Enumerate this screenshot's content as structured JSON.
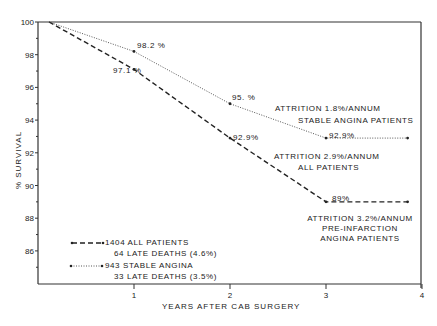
{
  "chart_data": {
    "type": "line",
    "title": "",
    "xlabel": "YEARS AFTER CAB SURGERY",
    "ylabel": "% SURVIVAL",
    "xlim": [
      0,
      4
    ],
    "ylim": [
      84,
      100
    ],
    "x_ticks": [
      "1",
      "2",
      "3",
      "4"
    ],
    "y_ticks": [
      "100",
      "98",
      "96",
      "94",
      "92",
      "90",
      "88",
      "86"
    ],
    "grid": false,
    "series": [
      {
        "name": "1404 ALL PATIENTS",
        "style": "dashed",
        "x": [
          0,
          1,
          2,
          3,
          3.85
        ],
        "values": [
          100,
          97.1,
          92.9,
          89,
          89
        ],
        "point_labels": [
          "",
          "97.1 %",
          "92.9%",
          "89%",
          ""
        ]
      },
      {
        "name": "943 STABLE ANGINA",
        "style": "dotted",
        "x": [
          0,
          1,
          2,
          3,
          3.85
        ],
        "values": [
          100,
          98.2,
          95,
          92.9,
          92.9
        ],
        "point_labels": [
          "",
          "98.2 %",
          "95. %",
          "92.9%",
          ""
        ]
      }
    ],
    "legend": [
      {
        "line1": "1404 ALL PATIENTS",
        "line2": "64 LATE DEATHS (4.6%)"
      },
      {
        "line1": "943 STABLE ANGINA",
        "line2": "33 LATE DEATHS (3.5%)"
      }
    ],
    "annotations": [
      {
        "line1": "ATTRITION 1.8%/ANNUM",
        "line2": "STABLE ANGINA PATIENTS"
      },
      {
        "line1": "ATTRITION 2.9%/ANNUM",
        "line2": "ALL PATIENTS"
      },
      {
        "line1": "ATTRITION 3.2%/ANNUM",
        "line2": "PRE-INFARCTION",
        "line3": "ANGINA PATIENTS"
      }
    ],
    "legend_position": "lower left"
  }
}
